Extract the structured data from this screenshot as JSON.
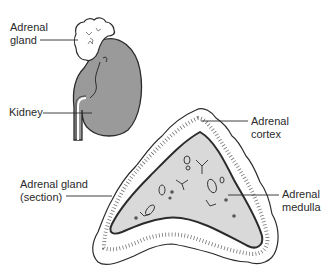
{
  "figure": {
    "type": "anatomical-diagram",
    "colors": {
      "kidney_fill": "#9a9a9a",
      "section_medulla_fill": "#d9d9d9",
      "outline": "#2b2b2b",
      "gland_fill": "#ffffff",
      "label_text": "#2a2a2a"
    }
  },
  "labels": {
    "adrenal_gland": {
      "line1": "Adrenal",
      "line2": "gland"
    },
    "kidney": {
      "line1": "Kidney"
    },
    "adrenal_cortex": {
      "line1": "Adrenal",
      "line2": "cortex"
    },
    "adrenal_gland_section": {
      "line1": "Adrenal gland",
      "line2": "(section)"
    },
    "adrenal_medulla": {
      "line1": "Adrenal",
      "line2": "medulla"
    }
  }
}
